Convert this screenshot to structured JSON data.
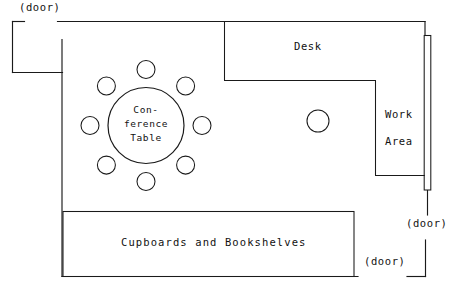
{
  "diagram": {
    "type": "floor-plan",
    "stroke_color": "#1a1a1a",
    "background_color": "#ffffff"
  },
  "labels": {
    "door_top_left": "(door)",
    "door_right": "(door)",
    "door_bottom": "(door)",
    "desk": "Desk",
    "work_area_line1": "Work",
    "work_area_line2": "Area",
    "conference_table_line1": "Con-",
    "conference_table_line2": "ference",
    "conference_table_line3": "Table",
    "cupboards": "Cupboards and Bookshelves"
  },
  "features": {
    "conference_table": {
      "name": "Conference Table",
      "shape": "circle",
      "center_x": 146,
      "center_y": 125,
      "radius": 38,
      "seat_count": 8,
      "seat_radius": 9,
      "seat_orbit_radius": 56
    },
    "work_area_seat": {
      "name": "Work Area Chair",
      "shape": "circle",
      "center_x": 318,
      "center_y": 121,
      "radius": 11
    },
    "cupboards_unit": {
      "name": "Cupboards and Bookshelves",
      "shape": "rectangle",
      "x": 63,
      "y": 211,
      "width": 291,
      "height": 65
    },
    "desk_unit": {
      "name": "Desk",
      "shape": "l-shape"
    },
    "right_partition": {
      "name": "Right Wall Partition",
      "shape": "rectangle",
      "x": 424,
      "y": 35,
      "width": 7,
      "height": 155
    },
    "alcove": {
      "name": "Top Left Alcove",
      "x": 12,
      "y": 21,
      "width": 50,
      "height": 51
    }
  },
  "doors": [
    {
      "id": "door-top-left",
      "label": "(door)",
      "wall": "top",
      "x1": 24,
      "x2": 57
    },
    {
      "id": "door-right",
      "label": "(door)",
      "wall": "right",
      "y1": 215,
      "y2": 240
    },
    {
      "id": "door-bottom",
      "label": "(door)",
      "wall": "bottom",
      "x1": 358,
      "x2": 407
    }
  ]
}
